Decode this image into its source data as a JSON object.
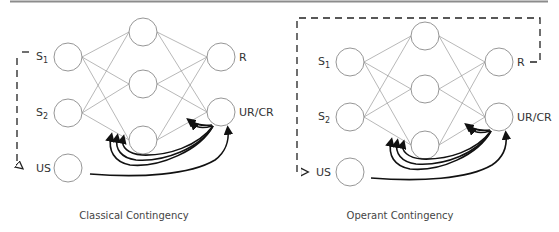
{
  "panels": [
    {
      "caption": "Classical Contingency",
      "labels": {
        "s1": "S",
        "s1_sub": "1",
        "s2": "S",
        "s2_sub": "2",
        "us": "US",
        "r": "R",
        "urcr": "UR/CR"
      }
    },
    {
      "caption": "Operant Contingency",
      "labels": {
        "s1": "S",
        "s1_sub": "1",
        "s2": "S",
        "s2_sub": "2",
        "us": "US",
        "r": "R",
        "urcr": "UR/CR"
      }
    }
  ],
  "colors": {
    "rule": "#8c8c8c",
    "node_stroke": "#8a8a8a",
    "arrow": "#111111"
  }
}
